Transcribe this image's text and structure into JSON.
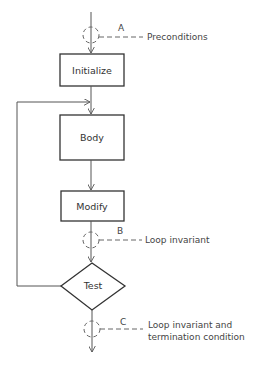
{
  "diagram": {
    "type": "flowchart",
    "colors": {
      "stroke": "#333333",
      "line": "#555555",
      "dashed": "#666666",
      "text": "#333333",
      "background": "#ffffff"
    },
    "nodes": [
      {
        "id": "initialize",
        "shape": "rectangle",
        "label": "Initialize"
      },
      {
        "id": "body",
        "shape": "rectangle",
        "label": "Body"
      },
      {
        "id": "modify",
        "shape": "rectangle",
        "label": "Modify"
      },
      {
        "id": "test",
        "shape": "diamond",
        "label": "Test"
      }
    ],
    "checkpoints": [
      {
        "id": "A",
        "letter": "A",
        "annotation": [
          "Preconditions"
        ]
      },
      {
        "id": "B",
        "letter": "B",
        "annotation": [
          "Loop invariant"
        ]
      },
      {
        "id": "C",
        "letter": "C",
        "annotation": [
          "Loop invariant and",
          "termination condition"
        ]
      }
    ],
    "edges": [
      {
        "from": "start",
        "to": "initialize",
        "via": "A"
      },
      {
        "from": "initialize",
        "to": "body"
      },
      {
        "from": "body",
        "to": "modify"
      },
      {
        "from": "modify",
        "to": "test",
        "via": "B"
      },
      {
        "from": "test",
        "to": "body",
        "label": "loop back"
      },
      {
        "from": "test",
        "to": "end",
        "via": "C"
      }
    ]
  }
}
